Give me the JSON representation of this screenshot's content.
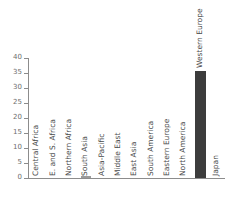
{
  "chart_data": {
    "type": "bar",
    "title": "",
    "subtitle": "",
    "xlabel": "",
    "ylabel": "",
    "ylim": [
      0,
      40
    ],
    "yticks": [
      0,
      5,
      10,
      15,
      20,
      25,
      30,
      35,
      40
    ],
    "ytick_labels": [
      "0",
      "5",
      "10",
      "15",
      "20",
      "25",
      "30",
      "35",
      "40"
    ],
    "grid": false,
    "legend": false,
    "legend_position": "none",
    "categories": [
      "Central Africa",
      "E. and S. Africa",
      "Northern Africa",
      "South Asia",
      "Asia-Pacific",
      "Middle East",
      "East Asia",
      "South America",
      "Eastern Europe",
      "North America",
      "Western Europe",
      "Japan"
    ],
    "values": [
      0,
      0,
      0,
      0.7,
      0,
      0,
      0,
      0,
      0,
      0,
      35.7,
      0
    ],
    "bar_colors": [
      "#7a7a7a",
      "#7a7a7a",
      "#7a7a7a",
      "#9b9b9b",
      "#7a7a7a",
      "#7a7a7a",
      "#7a7a7a",
      "#7a7a7a",
      "#7a7a7a",
      "#7a7a7a",
      "#3c3c3c",
      "#7a7a7a"
    ]
  },
  "style": {
    "axis_color": "#8c8c8c",
    "tick_label_color": "#6e6e6e",
    "category_label_color": "#4a4a4a",
    "background": "#ffffff",
    "bar_color_primary": "#3c3c3c",
    "bar_color_secondary": "#9b9b9b"
  }
}
